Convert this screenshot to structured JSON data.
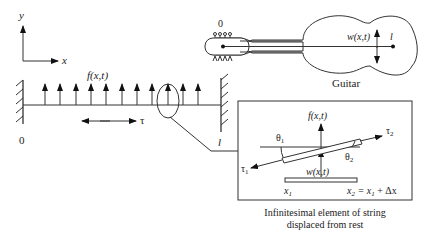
{
  "axes": {
    "y_label": "y",
    "x_label": "x"
  },
  "string": {
    "force_label": "f(x,t)",
    "tension_label": "τ",
    "left_end_label": "0",
    "right_end_label": "l",
    "arrow_count": 11
  },
  "guitar": {
    "caption": "Guitar",
    "origin_label": "0",
    "end_label": "l",
    "displacement_label": "w(x,t)"
  },
  "inset": {
    "force_label": "f(x,t)",
    "theta1_label": "θ",
    "theta1_sub": "1",
    "theta2_label": "θ",
    "theta2_sub": "2",
    "tau1_label": "τ",
    "tau1_sub": "1",
    "tau2_label": "τ",
    "tau2_sub": "2",
    "displacement_label": "w(x,t)",
    "x1_label": "x",
    "x1_sub": "1",
    "x2_label": "x",
    "x2_sub": "2",
    "x2_eq": " = x",
    "x2_eq_sub": "1",
    "x2_plus": " + Δx",
    "caption_line1": "Infinitesimal element of string",
    "caption_line2": "displaced from rest"
  },
  "colors": {
    "ink": "#222222",
    "background": "#ffffff"
  }
}
